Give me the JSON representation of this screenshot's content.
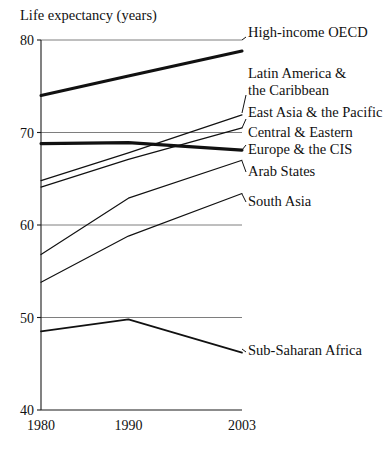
{
  "chart_data": {
    "type": "line",
    "title": "Life expectancy (years)",
    "xlabel": "",
    "ylabel": "Life expectancy (years)",
    "x": [
      1980,
      1990,
      2003
    ],
    "xticklabels": [
      "1980",
      "1990",
      "2003"
    ],
    "yticks": [
      40,
      50,
      60,
      70,
      80
    ],
    "yticklabels": [
      "40",
      "50",
      "60",
      "70",
      "80"
    ],
    "ylim": [
      40,
      80
    ],
    "xlim": [
      1980,
      2003
    ],
    "grid": "horizontal",
    "legend": "inline-right-labels",
    "series": [
      {
        "name": "High-income OECD",
        "label": "High-income OECD",
        "values": [
          74.0,
          76.1,
          78.8
        ],
        "weight": "bold",
        "label_lines": [
          "High-income OECD"
        ]
      },
      {
        "name": "Latin America & the Caribbean",
        "label": "Latin America & the Caribbean",
        "values": [
          64.8,
          67.8,
          71.9
        ],
        "weight": "normal",
        "label_lines": [
          "Latin America &",
          "the Caribbean"
        ]
      },
      {
        "name": "East Asia & the Pacific",
        "label": "East Asia & the Pacific",
        "values": [
          64.1,
          67.1,
          70.5
        ],
        "weight": "normal",
        "label_lines": [
          "East Asia & the Pacific"
        ]
      },
      {
        "name": "Central & Eastern Europe & the CIS",
        "label": "Central & Eastern Europe & the CIS",
        "values": [
          68.8,
          68.9,
          68.1
        ],
        "weight": "bold",
        "label_lines": [
          "Central & Eastern",
          "Europe & the CIS"
        ]
      },
      {
        "name": "Arab States",
        "label": "Arab States",
        "values": [
          56.8,
          62.9,
          67.0
        ],
        "weight": "normal",
        "label_lines": [
          "Arab States"
        ]
      },
      {
        "name": "South Asia",
        "label": "South Asia",
        "values": [
          53.8,
          58.8,
          63.4
        ],
        "weight": "normal",
        "label_lines": [
          "South Asia"
        ]
      },
      {
        "name": "Sub-Saharan Africa",
        "label": "Sub-Saharan Africa",
        "values": [
          48.5,
          49.8,
          46.2
        ],
        "weight": "medium",
        "label_lines": [
          "Sub-Saharan Africa"
        ]
      }
    ],
    "label_anchors": [
      {
        "series": "High-income OECD",
        "x": 248,
        "y": 37,
        "leader_from": [
          242,
          40
        ],
        "leader_to": [
          246,
          37
        ]
      },
      {
        "series": "Latin America & the Caribbean",
        "x": 248,
        "y": 78,
        "leader_from": [
          242,
          113
        ],
        "leader_to": [
          246,
          95
        ]
      },
      {
        "series": "East Asia & the Pacific",
        "x": 248,
        "y": 117,
        "leader_from": [
          242,
          128
        ],
        "leader_to": [
          246,
          119
        ]
      },
      {
        "series": "Central & Eastern Europe & the CIS",
        "x": 248,
        "y": 137,
        "leader_from": [
          242,
          150
        ],
        "leader_to": [
          246,
          145
        ]
      },
      {
        "series": "Arab States",
        "x": 248,
        "y": 176,
        "leader_from": [
          242,
          161
        ],
        "leader_to": [
          246,
          172
        ]
      },
      {
        "series": "South Asia",
        "x": 248,
        "y": 206,
        "leader_from": [
          242,
          194
        ],
        "leader_to": [
          246,
          202
        ]
      },
      {
        "series": "Sub-Saharan Africa",
        "x": 248,
        "y": 355,
        "leader_from": [
          242,
          349
        ],
        "leader_to": [
          246,
          352
        ]
      }
    ],
    "colors": {
      "line": "#111111",
      "grid": "#6f6f6f",
      "axis": "#1a1a1a",
      "background": "#ffffff"
    }
  }
}
